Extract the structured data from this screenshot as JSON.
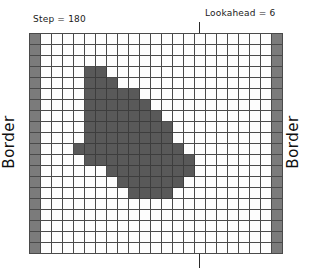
{
  "header": {
    "step_label": "Step = 180",
    "lookahead_label": "Lookahead = 6"
  },
  "side_labels": {
    "left": "Border",
    "right": "Border"
  },
  "icons": {
    "lookahead_marker": "vertical-line-marker"
  },
  "colors": {
    "background": "#ffffff",
    "grid_line": "#4a4a4a",
    "cell_empty": "#fdfdfd",
    "cell_filled": "#595959",
    "cell_border": "#7b7b7b",
    "text": "#1a1a1a",
    "marker_line": "#2b2b2b"
  },
  "chart_data": {
    "type": "heatmap",
    "title": "Step = 180",
    "xlabel": "",
    "ylabel": "",
    "grid": true,
    "legend_position": "none",
    "annotations": [
      {
        "text": "Step = 180",
        "position": "top-left"
      },
      {
        "text": "Lookahead = 6",
        "position": "top-right"
      },
      {
        "text": "Border",
        "position": "left",
        "rotation": -90
      },
      {
        "text": "Border",
        "position": "right",
        "rotation": -90
      }
    ],
    "columns": 23,
    "rows": 20,
    "lookahead_column": 15,
    "cell_states": {
      "0": "empty",
      "1": "filled",
      "2": "border"
    },
    "cells": [
      [
        2,
        0,
        0,
        0,
        0,
        0,
        0,
        0,
        0,
        0,
        0,
        0,
        0,
        0,
        0,
        0,
        0,
        0,
        0,
        0,
        0,
        0,
        2
      ],
      [
        2,
        0,
        0,
        0,
        0,
        0,
        0,
        0,
        0,
        0,
        0,
        0,
        0,
        0,
        0,
        0,
        0,
        0,
        0,
        0,
        0,
        0,
        2
      ],
      [
        2,
        0,
        0,
        0,
        0,
        0,
        0,
        0,
        0,
        0,
        0,
        0,
        0,
        0,
        0,
        0,
        0,
        0,
        0,
        0,
        0,
        0,
        2
      ],
      [
        2,
        0,
        0,
        0,
        0,
        1,
        1,
        0,
        0,
        0,
        0,
        0,
        0,
        0,
        0,
        0,
        0,
        0,
        0,
        0,
        0,
        0,
        2
      ],
      [
        2,
        0,
        0,
        0,
        0,
        1,
        1,
        1,
        0,
        0,
        0,
        0,
        0,
        0,
        0,
        0,
        0,
        0,
        0,
        0,
        0,
        0,
        2
      ],
      [
        2,
        0,
        0,
        0,
        0,
        1,
        1,
        1,
        1,
        1,
        0,
        0,
        0,
        0,
        0,
        0,
        0,
        0,
        0,
        0,
        0,
        0,
        2
      ],
      [
        2,
        0,
        0,
        0,
        0,
        1,
        1,
        1,
        1,
        1,
        1,
        0,
        0,
        0,
        0,
        0,
        0,
        0,
        0,
        0,
        0,
        0,
        2
      ],
      [
        2,
        0,
        0,
        0,
        0,
        1,
        1,
        1,
        1,
        1,
        1,
        1,
        0,
        0,
        0,
        0,
        0,
        0,
        0,
        0,
        0,
        0,
        2
      ],
      [
        2,
        0,
        0,
        0,
        0,
        1,
        1,
        1,
        1,
        1,
        1,
        1,
        1,
        0,
        0,
        0,
        0,
        0,
        0,
        0,
        0,
        0,
        2
      ],
      [
        2,
        0,
        0,
        0,
        0,
        1,
        1,
        1,
        1,
        1,
        1,
        1,
        1,
        0,
        0,
        0,
        0,
        0,
        0,
        0,
        0,
        0,
        2
      ],
      [
        2,
        0,
        0,
        0,
        1,
        1,
        1,
        1,
        1,
        1,
        1,
        1,
        1,
        1,
        0,
        0,
        0,
        0,
        0,
        0,
        0,
        0,
        2
      ],
      [
        2,
        0,
        0,
        0,
        0,
        1,
        1,
        1,
        1,
        1,
        1,
        1,
        1,
        1,
        1,
        0,
        0,
        0,
        0,
        0,
        0,
        0,
        2
      ],
      [
        2,
        0,
        0,
        0,
        0,
        0,
        0,
        1,
        1,
        1,
        1,
        1,
        1,
        1,
        1,
        0,
        0,
        0,
        0,
        0,
        0,
        0,
        2
      ],
      [
        2,
        0,
        0,
        0,
        0,
        0,
        0,
        0,
        1,
        1,
        1,
        1,
        1,
        1,
        0,
        0,
        0,
        0,
        0,
        0,
        0,
        0,
        2
      ],
      [
        2,
        0,
        0,
        0,
        0,
        0,
        0,
        0,
        0,
        1,
        1,
        1,
        1,
        0,
        0,
        0,
        0,
        0,
        0,
        0,
        0,
        0,
        2
      ],
      [
        2,
        0,
        0,
        0,
        0,
        0,
        0,
        0,
        0,
        0,
        0,
        0,
        0,
        0,
        0,
        0,
        0,
        0,
        0,
        0,
        0,
        0,
        2
      ],
      [
        2,
        0,
        0,
        0,
        0,
        0,
        0,
        0,
        0,
        0,
        0,
        0,
        0,
        0,
        0,
        0,
        0,
        0,
        0,
        0,
        0,
        0,
        2
      ],
      [
        2,
        0,
        0,
        0,
        0,
        0,
        0,
        0,
        0,
        0,
        0,
        0,
        0,
        0,
        0,
        0,
        0,
        0,
        0,
        0,
        0,
        0,
        2
      ],
      [
        2,
        0,
        0,
        0,
        0,
        0,
        0,
        0,
        0,
        0,
        0,
        0,
        0,
        0,
        0,
        0,
        0,
        0,
        0,
        0,
        0,
        0,
        2
      ],
      [
        2,
        0,
        0,
        0,
        0,
        0,
        0,
        0,
        0,
        0,
        0,
        0,
        0,
        0,
        0,
        0,
        0,
        0,
        0,
        0,
        0,
        0,
        2
      ]
    ]
  }
}
